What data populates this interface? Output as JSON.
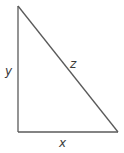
{
  "diagram": {
    "type": "right-triangle",
    "stroke_color": "#5a5a5a",
    "label_color": "#3a3a3a",
    "vertices": {
      "top": [
        18,
        6
      ],
      "bottom_left": [
        18,
        132
      ],
      "bottom_right": [
        118,
        132
      ]
    },
    "labels": {
      "vertical_side": "y",
      "hypotenuse": "z",
      "horizontal_side": "x"
    }
  }
}
